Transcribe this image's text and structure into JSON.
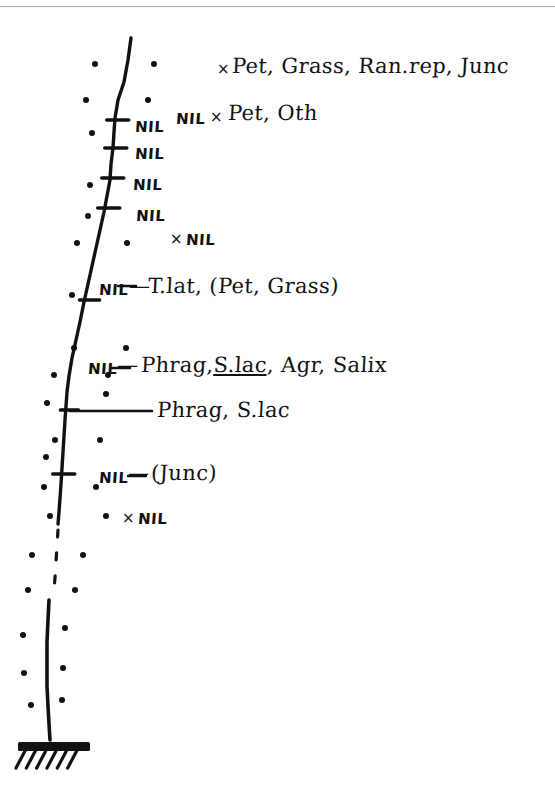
{
  "document": {
    "kind": "hand-drawn core-log sketch",
    "background_color": "#ffffff",
    "ink_color": "#111111",
    "rule_color": "#9a9a9a"
  },
  "annotations": {
    "top_species_line": "Pet, Grass, Ran.rep, Junc",
    "second_species_line": "Pet, Oth",
    "nil_before_second": "NIL",
    "t_lat_line": "T.lat, (Pet, Grass)",
    "phrag_full_line_pre": "Phrag,",
    "phrag_full_line_underlined": "S.lac",
    "phrag_full_line_post": ", Agr, Salix",
    "phrag_short_line": "Phrag, S.lac",
    "junc_line": "(Junc)",
    "cross_mark": "×",
    "dash_mark": "—"
  },
  "nil_labels": [
    {
      "id": "nil-tick-1",
      "text": "NIL",
      "x": 135,
      "y": 118
    },
    {
      "id": "nil-tick-2",
      "text": "NIL",
      "x": 135,
      "y": 145
    },
    {
      "id": "nil-tick-3",
      "text": "NIL",
      "x": 133,
      "y": 176
    },
    {
      "id": "nil-tick-4",
      "text": "NIL",
      "x": 136,
      "y": 207
    },
    {
      "id": "nil-loose-1",
      "text": "NIL",
      "x": 186,
      "y": 231
    },
    {
      "id": "nil-tlat",
      "text": "NIL",
      "x": 99,
      "y": 281
    },
    {
      "id": "nil-phrag",
      "text": "NIL",
      "x": 88,
      "y": 360
    },
    {
      "id": "nil-junc",
      "text": "NIL",
      "x": 99,
      "y": 469
    },
    {
      "id": "nil-loose-2",
      "text": "NIL",
      "x": 138,
      "y": 510
    }
  ],
  "chart_data": {
    "type": "line",
    "title": "",
    "xlabel": "",
    "ylabel": "",
    "profile_trace": [
      [
        131,
        38
      ],
      [
        128,
        60
      ],
      [
        124,
        82
      ],
      [
        118,
        100
      ],
      [
        115,
        118
      ],
      [
        114,
        132
      ],
      [
        113,
        148
      ],
      [
        111,
        164
      ],
      [
        110,
        180
      ],
      [
        107,
        196
      ],
      [
        104,
        212
      ],
      [
        100,
        230
      ],
      [
        96,
        248
      ],
      [
        92,
        266
      ],
      [
        88,
        284
      ],
      [
        84,
        302
      ],
      [
        80,
        322
      ],
      [
        76,
        340
      ],
      [
        72,
        358
      ],
      [
        69,
        376
      ],
      [
        67,
        392
      ],
      [
        66,
        406
      ],
      [
        65,
        420
      ],
      [
        64,
        436
      ],
      [
        63,
        452
      ],
      [
        62,
        468
      ],
      [
        61,
        484
      ],
      [
        60,
        498
      ],
      [
        59,
        512
      ],
      [
        58,
        524
      ]
    ],
    "dashed_trace": [
      [
        58,
        530
      ],
      [
        57,
        546
      ],
      [
        56,
        562
      ],
      [
        55,
        578
      ],
      [
        54,
        590
      ]
    ],
    "lower_trace": [
      [
        49,
        600
      ],
      [
        48,
        620
      ],
      [
        47,
        642
      ],
      [
        47,
        664
      ],
      [
        47,
        686
      ],
      [
        48,
        706
      ],
      [
        49,
        724
      ],
      [
        50,
        740
      ]
    ],
    "ticks": [
      {
        "x": 116,
        "y": 120,
        "w": 22
      },
      {
        "x": 114,
        "y": 148,
        "w": 22
      },
      {
        "x": 111,
        "y": 178,
        "w": 22
      },
      {
        "x": 107,
        "y": 208,
        "w": 22
      },
      {
        "x": 88,
        "y": 300,
        "w": 20
      },
      {
        "x": 68,
        "y": 410,
        "w": 18
      },
      {
        "x": 62,
        "y": 474,
        "w": 22
      }
    ],
    "leader_lines": [
      {
        "x1": 118,
        "y1": 286,
        "x2": 136,
        "y2": 286
      },
      {
        "x1": 112,
        "y1": 368,
        "x2": 130,
        "y2": 368
      },
      {
        "x1": 70,
        "y1": 411,
        "x2": 152,
        "y2": 411
      },
      {
        "x1": 128,
        "y1": 476,
        "x2": 146,
        "y2": 476
      }
    ],
    "stipple_dots": [
      [
        95,
        64
      ],
      [
        154,
        64
      ],
      [
        86,
        100
      ],
      [
        148,
        100
      ],
      [
        92,
        133
      ],
      [
        90,
        185
      ],
      [
        88,
        216
      ],
      [
        77,
        243
      ],
      [
        127,
        243
      ],
      [
        72,
        295
      ],
      [
        74,
        348
      ],
      [
        126,
        348
      ],
      [
        54,
        375
      ],
      [
        108,
        375
      ],
      [
        47,
        403
      ],
      [
        106,
        394
      ],
      [
        55,
        440
      ],
      [
        100,
        440
      ],
      [
        46,
        457
      ],
      [
        44,
        487
      ],
      [
        96,
        487
      ],
      [
        50,
        516
      ],
      [
        106,
        516
      ],
      [
        32,
        555
      ],
      [
        83,
        555
      ],
      [
        28,
        590
      ],
      [
        75,
        590
      ],
      [
        23,
        635
      ],
      [
        65,
        628
      ],
      [
        24,
        673
      ],
      [
        63,
        668
      ],
      [
        31,
        705
      ],
      [
        62,
        700
      ]
    ],
    "base": {
      "bar_x": 18,
      "bar_y": 742,
      "bar_w": 72,
      "bar_h": 9,
      "hatch_count": 6
    }
  }
}
